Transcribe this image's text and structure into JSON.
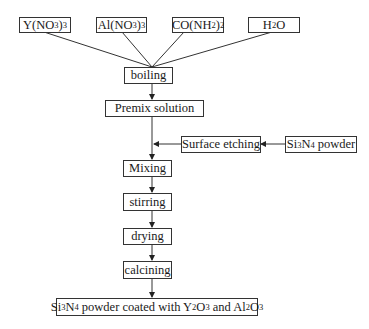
{
  "diagram": {
    "type": "process-flowchart",
    "inputs": [
      {
        "id": "y_nitrate",
        "parts": [
          "Y(NO",
          "3",
          ")",
          "3",
          ""
        ]
      },
      {
        "id": "al_nitrate",
        "parts": [
          "Al(NO",
          "3",
          ")",
          "3",
          ""
        ]
      },
      {
        "id": "urea",
        "parts": [
          "CO(NH",
          "2",
          ")",
          "2",
          ""
        ]
      },
      {
        "id": "water",
        "parts": [
          "H",
          "2",
          "O",
          "",
          ""
        ]
      }
    ],
    "steps": {
      "boiling": "boiling",
      "premix": "Premix solution",
      "surface_etching": "Surface etching",
      "mixing": "Mixing",
      "stirring": "stirring",
      "drying": "drying",
      "calcining": "calcining"
    },
    "side_input": {
      "parts": [
        "Si",
        "3",
        "N",
        "4",
        " powder"
      ]
    },
    "product": {
      "parts": [
        "Si",
        "3",
        "N",
        "4",
        " powder coated with Y",
        "2",
        "O",
        "3",
        " and Al",
        "2",
        "O",
        "3"
      ]
    },
    "edges": [
      [
        "Y(NO3)3",
        "boiling"
      ],
      [
        "Al(NO3)3",
        "boiling"
      ],
      [
        "CO(NH2)2",
        "boiling"
      ],
      [
        "H2O",
        "boiling"
      ],
      [
        "boiling",
        "Premix solution"
      ],
      [
        "Premix solution",
        "Mixing"
      ],
      [
        "Si3N4 powder",
        "Surface etching"
      ],
      [
        "Surface etching",
        "Mixing"
      ],
      [
        "Mixing",
        "stirring"
      ],
      [
        "stirring",
        "drying"
      ],
      [
        "drying",
        "calcining"
      ],
      [
        "calcining",
        "Si3N4 powder coated with Y2O3 and Al2O3"
      ]
    ]
  }
}
